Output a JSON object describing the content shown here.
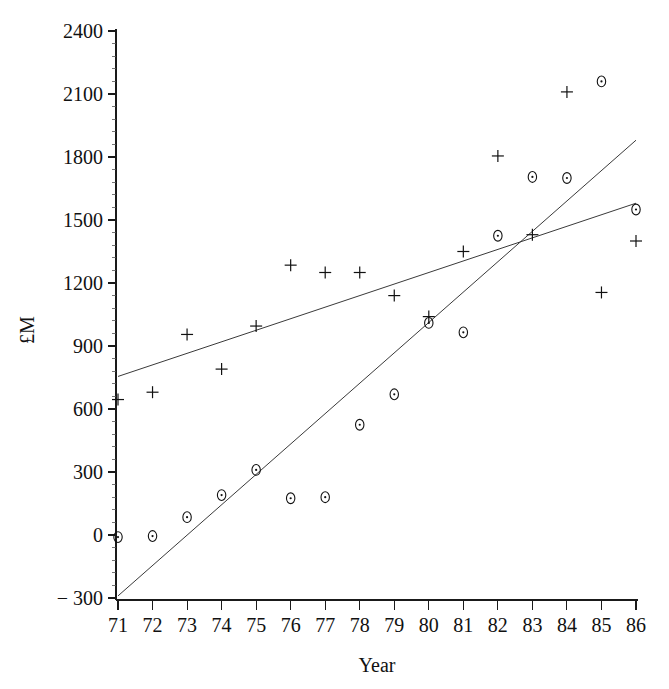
{
  "chart_data": {
    "type": "scatter",
    "title": "",
    "xlabel": "Year",
    "ylabel": "£M",
    "xlim": [
      70.6,
      86.4
    ],
    "ylim": [
      -340,
      2460
    ],
    "grid": false,
    "legend": "none",
    "x_ticks": [
      71,
      72,
      73,
      74,
      75,
      76,
      77,
      78,
      79,
      80,
      81,
      82,
      83,
      84,
      85,
      86
    ],
    "x_tick_labels": [
      "71",
      "72",
      "73",
      "74",
      "75",
      "76",
      "77",
      "78",
      "79",
      "80",
      "81",
      "82",
      "83",
      "84",
      "85",
      "86"
    ],
    "y_ticks": [
      -300,
      0,
      300,
      600,
      900,
      1200,
      1500,
      1800,
      2100,
      2400
    ],
    "y_tick_labels": [
      "− 300",
      "0",
      "300",
      "600",
      "900",
      "1200",
      "1500",
      "1800",
      "2100",
      "2400"
    ],
    "y_minor_step": 60,
    "series": [
      {
        "name": "plus-series",
        "marker": "plus",
        "x": [
          71,
          72,
          73,
          74,
          75,
          76,
          77,
          78,
          79,
          80,
          81,
          82,
          83,
          84,
          85,
          86
        ],
        "values": [
          645,
          680,
          955,
          790,
          995,
          1285,
          1250,
          1250,
          1140,
          1040,
          1350,
          1805,
          1430,
          2110,
          1155,
          1400
        ]
      },
      {
        "name": "circle-series",
        "marker": "circle",
        "x": [
          71,
          72,
          73,
          74,
          75,
          76,
          77,
          78,
          79,
          80,
          81,
          82,
          83,
          84,
          85,
          86
        ],
        "values": [
          -10,
          -5,
          85,
          190,
          310,
          175,
          180,
          525,
          670,
          1010,
          965,
          1425,
          1705,
          1700,
          2160,
          1550
        ]
      }
    ],
    "fit_lines": [
      {
        "name": "plus-series-fit",
        "x0": 71,
        "y0": 755,
        "x1": 86,
        "y1": 1580
      },
      {
        "name": "circle-series-fit",
        "x0": 71,
        "y0": -290,
        "x1": 86,
        "y1": 1880
      }
    ]
  }
}
